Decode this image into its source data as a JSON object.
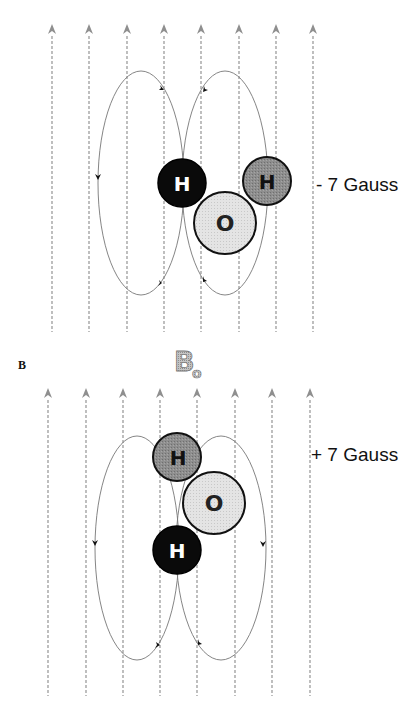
{
  "panels": [
    {
      "id": "A",
      "field_label": "- 7 Gauss",
      "atoms": [
        {
          "symbol": "H",
          "shade": "black"
        },
        {
          "symbol": "H",
          "shade": "dark-gray"
        },
        {
          "symbol": "O",
          "shade": "light-gray"
        }
      ]
    },
    {
      "id": "B",
      "panel_letter": "B",
      "field_label": "+ 7 Gauss",
      "atoms": [
        {
          "symbol": "H",
          "shade": "dark-gray"
        },
        {
          "symbol": "O",
          "shade": "light-gray"
        },
        {
          "symbol": "H",
          "shade": "black"
        }
      ]
    }
  ],
  "field_symbol": {
    "main": "B",
    "subscript": "o"
  },
  "colors": {
    "field_line": "#8a8a8a",
    "loop_line": "#777777",
    "h_black": "#0a0a0a",
    "h_gray": "#8c8c8c",
    "o_light": "#e2e2e2"
  }
}
